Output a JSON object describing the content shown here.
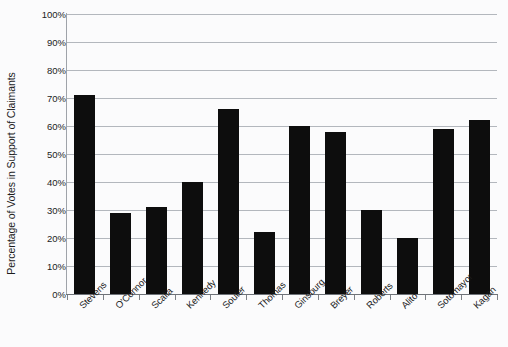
{
  "chart_data": {
    "type": "bar",
    "title": "",
    "xlabel": "",
    "ylabel": "Percentage of Votes in Support of Claimants",
    "ylim": [
      0,
      100
    ],
    "y_unit": "%",
    "grid": true,
    "legend": "none",
    "categories": [
      "Stevens",
      "O'Connor",
      "Scalia",
      "Kennedy",
      "Souter",
      "Thomas",
      "Ginsburg",
      "Breyer",
      "Roberts",
      "Alito",
      "Sotomayor",
      "Kagan"
    ],
    "values": [
      71,
      29,
      31,
      40,
      66,
      22,
      60,
      58,
      30,
      20,
      59,
      62
    ],
    "y_ticks": [
      "0%",
      "10%",
      "20%",
      "30%",
      "40%",
      "50%",
      "60%",
      "70%",
      "80%",
      "90%",
      "100%"
    ],
    "colors": {
      "bar": "#0d0d0d",
      "gridline": "#b3b7bd",
      "axis": "#6e7278",
      "background": "#fbfbfc",
      "text": "#1c1c1c"
    }
  }
}
